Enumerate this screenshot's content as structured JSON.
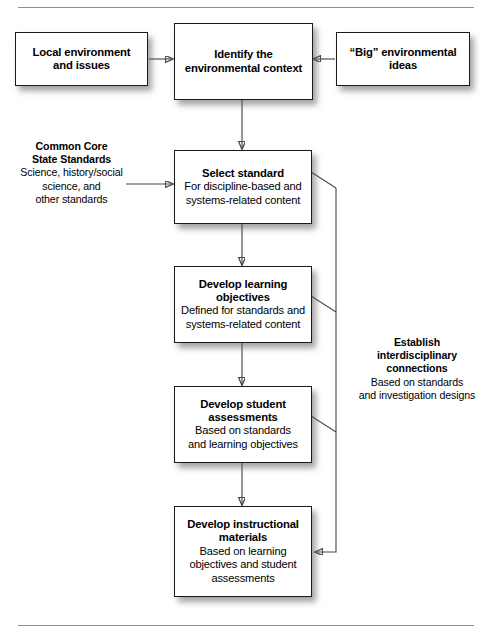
{
  "diagram": {
    "type": "flowchart",
    "title_rules": {
      "top": "horizontal-rule",
      "bottom": "horizontal-rule"
    },
    "nodes": {
      "local_environment": {
        "title": "Local environment",
        "subtitle": "and issues"
      },
      "identify_context": {
        "title_line1": "Identify the",
        "title_line2": "environmental context"
      },
      "big_ideas": {
        "title_line1": "“Big” environmental",
        "title_line2": "ideas"
      },
      "select_standard": {
        "title": "Select standard",
        "sub_line1": "For discipline-based and",
        "sub_line2": "systems-related content"
      },
      "develop_objectives": {
        "title_line1": "Develop learning",
        "title_line2": "objectives",
        "sub_line1": "Defined for standards and",
        "sub_line2": "systems-related content"
      },
      "develop_assessments": {
        "title_line1": "Develop student",
        "title_line2": "assessments",
        "sub_line1": "Based on standards",
        "sub_line2": "and learning objectives"
      },
      "develop_materials": {
        "title_line1": "Develop instructional",
        "title_line2": "materials",
        "sub_line1": "Based on learning",
        "sub_line2": "objectives and student",
        "sub_line3": "assessments"
      }
    },
    "annotations": {
      "common_core": {
        "title_line1": "Common Core",
        "title_line2": "State Standards",
        "sub_line1": "Science, history/social",
        "sub_line2": "science, and",
        "sub_line3": "other standards"
      },
      "interdisciplinary": {
        "title_line1": "Establish",
        "title_line2": "interdisciplinary",
        "title_line3": "connections",
        "sub_line1": "Based on standards",
        "sub_line2": "and investigation designs"
      }
    },
    "colors": {
      "box_fill": "#ffffff",
      "box_border": "#1a1a1a",
      "connector": "#4a4a4a",
      "text": "#000000",
      "rule": "#8e8e8e"
    }
  }
}
